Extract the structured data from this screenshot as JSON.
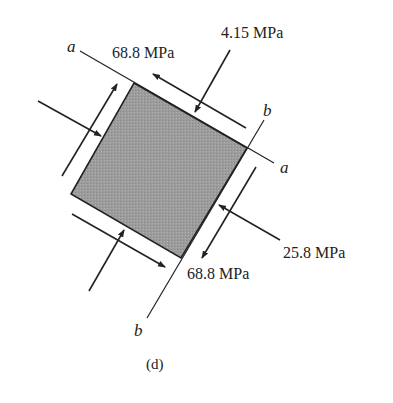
{
  "figure": {
    "caption": "(d)",
    "element_fill": "#9a9a9a",
    "line_color": "#222222",
    "axes": {
      "a_top": "a",
      "a_right": "a",
      "b_top": "b",
      "b_bottom": "b"
    },
    "stresses": {
      "shear_top": "68.8 MPa",
      "normal_top": "4.15 MPa",
      "normal_right": "25.8 MPa",
      "shear_bottom": "68.8 MPa"
    }
  }
}
